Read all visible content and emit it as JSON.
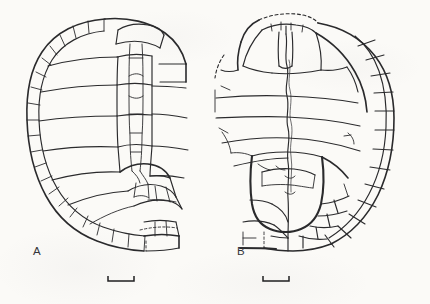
{
  "figure": {
    "kind": "scientific-line-drawing",
    "background_color": "#fbfaf7",
    "ink_color": "#2a2a2c",
    "panel_count": 2
  },
  "panels": [
    {
      "id": "A",
      "label": "A",
      "view": "carapace (dorsal shell), partly reconstructed",
      "label_position": {
        "x": 33,
        "y": 245
      },
      "scalebar": {
        "name": "scale-bar-a",
        "x": 108,
        "y": 281,
        "length_px": 26,
        "tick_height_px": 5,
        "orientation": "horizontal-with-upward-end-ticks"
      },
      "features": [
        "marginal scute series around left and lower rim",
        "pleural (costal) scute series",
        "vertebral (neural) scute series along midline",
        "nuchal region at anterior margin",
        "dashed broken edge at posterior-right margin",
        "incomplete / eroded right lateral margin"
      ]
    },
    {
      "id": "B",
      "label": "B",
      "view": "plastron (ventral shell), partly reconstructed",
      "label_position": {
        "x": 237,
        "y": 245
      },
      "scalebar": {
        "name": "scale-bar-b",
        "x": 263,
        "y": 281,
        "length_px": 26,
        "tick_height_px": 5,
        "orientation": "horizontal-with-upward-end-ticks"
      },
      "features": [
        "dashed anterior (gular) margin",
        "gular and humeral scutes at anterior lobe",
        "pectoral, abdominal, femoral and anal scute seams",
        "central midline seam running full length",
        "inframarginal / bridge scutes at right side",
        "fragmentary, reconstructed left lateral margin"
      ]
    }
  ]
}
